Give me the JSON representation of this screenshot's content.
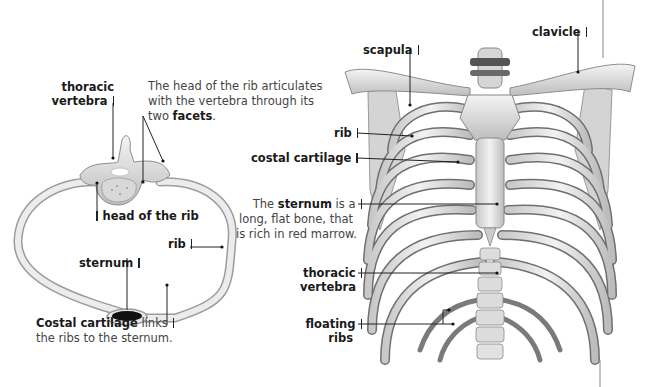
{
  "left_figure": {
    "title": "Cross-section of a rib and thoracic vertebra",
    "labels": {
      "thoracic_vertebra_line1": "thoracic",
      "thoracic_vertebra_line2": "vertebra",
      "facets_line1": "The head of the rib articulates",
      "facets_line2": "with the vertebra through its",
      "facets_line3_pre": "two ",
      "facets_line3_bold": "facets",
      "facets_line3_post": ".",
      "head_of_rib": "head of the rib",
      "rib": "rib",
      "sternum": "sternum",
      "costal_bold": "Costal cartilage",
      "costal_rest": " links",
      "costal_line2": "the ribs to the sternum."
    }
  },
  "right_figure": {
    "title": "Anterior view of the rib cage",
    "labels": {
      "scapula": "scapula",
      "clavicle": "clavicle",
      "rib": "rib",
      "costal_cartilage": "costal cartilage",
      "sternum_pre": "The ",
      "sternum_bold": "sternum",
      "sternum_post": " is a",
      "sternum_line2": "long, flat bone, that",
      "sternum_line3": "is rich in red marrow.",
      "thoracic_line1": "thoracic",
      "thoracic_line2": "vertebra",
      "floating_line1": "floating",
      "floating_line2": "ribs"
    }
  },
  "colors": {
    "bone": "#e4e4e4",
    "bone_shadow": "#9a9a9a",
    "cavity_dark": "#4a4a4a",
    "leader_line": "#222222",
    "text": "#1a1a1a"
  }
}
